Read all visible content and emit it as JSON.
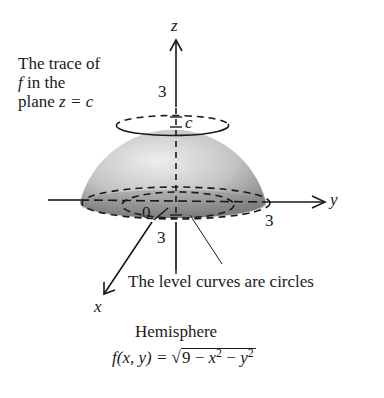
{
  "figure": {
    "surface_name": "Hemisphere",
    "trace_annotation": {
      "line1": "The trace of",
      "line2_var": "f",
      "line2_rest": " in the",
      "line3_prefix": "plane ",
      "line3_eq": "z = c"
    },
    "level_curves_annotation": "The level curves are circles",
    "formula": {
      "lhs": "f(x, y) = ",
      "radicand_const": "9 − ",
      "x_var": "x",
      "mid": " − ",
      "y_var": "y",
      "exponent": "2"
    },
    "axes": {
      "z_label": "z",
      "y_label": "y",
      "x_label": "x",
      "z_tick": "3",
      "y_tick": "3",
      "x_tick": "3",
      "origin_label": "0",
      "c_label": "c"
    },
    "colors": {
      "ink": "#1a1a1a",
      "surface_light": "#e8e8e8",
      "surface_dark": "#7a7a7a",
      "background": "#ffffff"
    }
  }
}
